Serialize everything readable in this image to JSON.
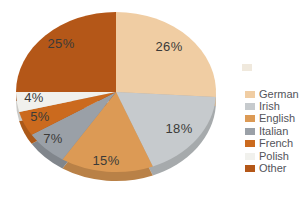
{
  "chart_data": {
    "type": "pie",
    "title": "",
    "categories": [
      "German",
      "Irish",
      "English",
      "Italian",
      "French",
      "Polish",
      "Other"
    ],
    "values": [
      26,
      18,
      15,
      7,
      5,
      4,
      25
    ],
    "unit": "%",
    "slice_labels": [
      "26%",
      "18%",
      "15%",
      "7%",
      "5%",
      "4%",
      "25%"
    ],
    "colors": [
      "#f0cda3",
      "#c6cacd",
      "#dc9a55",
      "#9aa0a7",
      "#cb6a1e",
      "#f1f1ed",
      "#b45718"
    ],
    "start_angle_deg": 0,
    "direction": "clockwise",
    "style": "3d",
    "legend_position": "right"
  },
  "legend": {
    "items": [
      {
        "label": "German",
        "color": "#f0cda3"
      },
      {
        "label": "Irish",
        "color": "#c6cacd"
      },
      {
        "label": "English",
        "color": "#dc9a55"
      },
      {
        "label": "Italian",
        "color": "#9aa0a7"
      },
      {
        "label": "French",
        "color": "#cb6a1e"
      },
      {
        "label": "Polish",
        "color": "#f1f1ed"
      },
      {
        "label": "Other",
        "color": "#b45718"
      }
    ]
  },
  "styles": {
    "background": "#ffffff",
    "slice_label_color": "#3b3a38",
    "legend_text_color": "#53545a"
  }
}
